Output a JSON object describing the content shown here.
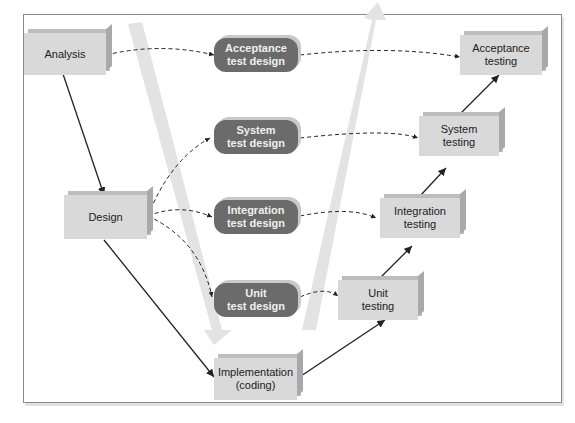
{
  "diagram": {
    "type": "V-model of software testing",
    "development_boxes": [
      {
        "id": "analysis",
        "lines": [
          "Analysis"
        ]
      },
      {
        "id": "design",
        "lines": [
          "Design"
        ]
      },
      {
        "id": "implementation",
        "lines": [
          "Implementation",
          "(coding)"
        ]
      }
    ],
    "test_design_boxes": [
      {
        "id": "acceptance_test_design",
        "lines": [
          "Acceptance",
          "test design"
        ]
      },
      {
        "id": "system_test_design",
        "lines": [
          "System",
          "test design"
        ]
      },
      {
        "id": "integration_test_design",
        "lines": [
          "Integration",
          "test design"
        ]
      },
      {
        "id": "unit_test_design",
        "lines": [
          "Unit",
          "test design"
        ]
      }
    ],
    "testing_boxes": [
      {
        "id": "unit_testing",
        "lines": [
          "Unit",
          "testing"
        ]
      },
      {
        "id": "integration_testing",
        "lines": [
          "Integration",
          "testing"
        ]
      },
      {
        "id": "system_testing",
        "lines": [
          "System",
          "testing"
        ]
      },
      {
        "id": "acceptance_testing",
        "lines": [
          "Acceptance",
          "testing"
        ]
      }
    ],
    "solid_arrows": [
      [
        "analysis",
        "design"
      ],
      [
        "design",
        "implementation"
      ],
      [
        "implementation",
        "unit_testing"
      ],
      [
        "unit_testing",
        "integration_testing"
      ],
      [
        "integration_testing",
        "system_testing"
      ],
      [
        "system_testing",
        "acceptance_testing"
      ]
    ],
    "dashed_arrows": [
      [
        "analysis",
        "acceptance_test_design"
      ],
      [
        "design",
        "system_test_design"
      ],
      [
        "design",
        "integration_test_design"
      ],
      [
        "design",
        "unit_test_design"
      ],
      [
        "acceptance_test_design",
        "acceptance_testing"
      ],
      [
        "system_test_design",
        "system_testing"
      ],
      [
        "integration_test_design",
        "integration_testing"
      ],
      [
        "unit_test_design",
        "unit_testing"
      ]
    ],
    "colors": {
      "box": "#d9d9d9",
      "pill": "#6b6b6b",
      "band": "#e3e3e3",
      "line": "#222222"
    }
  }
}
